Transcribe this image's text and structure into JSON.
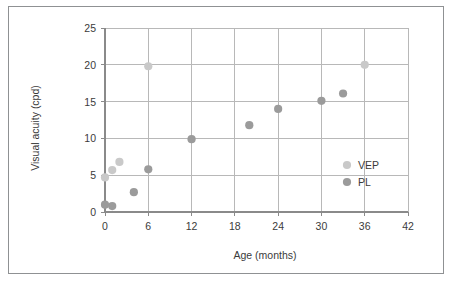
{
  "figure": {
    "border_color": "#8f9193",
    "background": "#ffffff"
  },
  "chart_data": {
    "type": "scatter",
    "title": "",
    "xlabel": "Age (months)",
    "ylabel": "Visual acuity (cpd)",
    "xlim": [
      0,
      42
    ],
    "ylim": [
      0,
      25
    ],
    "xticks": [
      0,
      6,
      12,
      18,
      24,
      30,
      36,
      42
    ],
    "yticks": [
      0,
      5,
      10,
      15,
      20,
      25
    ],
    "xtick_labels": [
      "0",
      "6",
      "12",
      "18",
      "24",
      "30",
      "36",
      "42"
    ],
    "ytick_labels": [
      "0",
      "5",
      "10",
      "15",
      "20",
      "25"
    ],
    "grid": true,
    "grid_color": "#b8b8b8",
    "legend_position": "inside-right",
    "series": [
      {
        "name": "VEP",
        "color": "#c9c9c9",
        "marker": "circle",
        "points": [
          {
            "x": 0,
            "y": 4.7
          },
          {
            "x": 1,
            "y": 5.7
          },
          {
            "x": 2,
            "y": 6.8
          },
          {
            "x": 6,
            "y": 19.8
          },
          {
            "x": 36,
            "y": 20.0
          }
        ]
      },
      {
        "name": "PL",
        "color": "#9b9b9b",
        "marker": "circle",
        "points": [
          {
            "x": 0,
            "y": 1.0
          },
          {
            "x": 1,
            "y": 0.8
          },
          {
            "x": 4,
            "y": 2.7
          },
          {
            "x": 6,
            "y": 5.8
          },
          {
            "x": 12,
            "y": 9.9
          },
          {
            "x": 20,
            "y": 11.8
          },
          {
            "x": 24,
            "y": 14.0
          },
          {
            "x": 30,
            "y": 15.1
          },
          {
            "x": 33,
            "y": 16.1
          }
        ]
      }
    ],
    "legend_entries": [
      {
        "label": "VEP",
        "color": "#c9c9c9"
      },
      {
        "label": "PL",
        "color": "#9b9b9b"
      }
    ]
  }
}
